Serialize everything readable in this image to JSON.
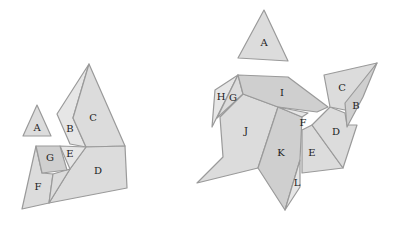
{
  "figures": [
    {
      "name": "left-figure",
      "pieces": [
        {
          "label": "A"
        },
        {
          "label": "B"
        },
        {
          "label": "C"
        },
        {
          "label": "D"
        },
        {
          "label": "E"
        },
        {
          "label": "F"
        },
        {
          "label": "G"
        }
      ]
    },
    {
      "name": "right-figure",
      "pieces": [
        {
          "label": "A"
        },
        {
          "label": "B"
        },
        {
          "label": "C"
        },
        {
          "label": "D"
        },
        {
          "label": "E"
        },
        {
          "label": "F"
        },
        {
          "label": "G"
        },
        {
          "label": "H"
        },
        {
          "label": "I"
        },
        {
          "label": "J"
        },
        {
          "label": "K"
        },
        {
          "label": "L"
        }
      ]
    }
  ]
}
